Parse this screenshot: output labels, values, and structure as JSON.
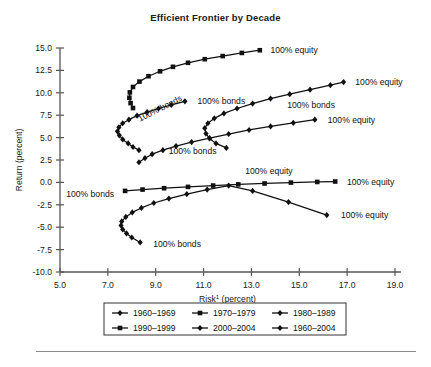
{
  "chart_data": {
    "type": "line",
    "title": "Efficient Frontier by Decade",
    "xlabel": "Risk¹ (percent)",
    "ylabel": "Return (percent)",
    "xlim": [
      5.0,
      19.0
    ],
    "ylim": [
      -10.0,
      15.0
    ],
    "xticks": [
      "5.0",
      "7.0",
      "9.0",
      "11.0",
      "13.0",
      "15.0",
      "17.0",
      "19.0"
    ],
    "yticks": [
      "15.0",
      "12.5",
      "10.0",
      "7.5",
      "5.0",
      "2.5",
      "0.0",
      "-2.5",
      "-5.0",
      "-7.5",
      "-10.0"
    ],
    "grid": false,
    "legend_position": "bottom",
    "series": [
      {
        "name": "1960–1969",
        "marker": "diamond",
        "bonds_label": "100% bonds",
        "equity_label": "100% equity",
        "points": [
          [
            8.3,
            3.6
          ],
          [
            8.05,
            3.95
          ],
          [
            7.85,
            4.35
          ],
          [
            7.62,
            4.8
          ],
          [
            7.48,
            5.25
          ],
          [
            7.4,
            5.7
          ],
          [
            7.46,
            6.15
          ],
          [
            7.62,
            6.6
          ],
          [
            7.88,
            7.0
          ],
          [
            8.22,
            7.45
          ],
          [
            8.64,
            7.85
          ],
          [
            9.12,
            8.25
          ],
          [
            9.65,
            8.65
          ],
          [
            10.22,
            9.05
          ]
        ]
      },
      {
        "name": "1970–1979",
        "marker": "square",
        "bonds_label": "100% bonds",
        "equity_label": "100% equity",
        "points": [
          [
            7.72,
            -0.95
          ],
          [
            8.45,
            -0.8
          ],
          [
            9.35,
            -0.65
          ],
          [
            10.35,
            -0.5
          ],
          [
            11.4,
            -0.35
          ],
          [
            12.45,
            -0.22
          ],
          [
            13.55,
            -0.12
          ],
          [
            14.65,
            -0.02
          ],
          [
            15.75,
            0.05
          ],
          [
            16.5,
            0.1
          ]
        ]
      },
      {
        "name": "1980–1989",
        "marker": "diamond",
        "bonds_label": "100% bonds",
        "equity_label": "100% equity",
        "points": [
          [
            11.95,
            3.85
          ],
          [
            11.52,
            4.35
          ],
          [
            11.25,
            4.9
          ],
          [
            11.1,
            5.45
          ],
          [
            11.05,
            6.05
          ],
          [
            11.18,
            6.6
          ],
          [
            11.45,
            7.15
          ],
          [
            11.85,
            7.7
          ],
          [
            12.4,
            8.25
          ],
          [
            13.05,
            8.8
          ],
          [
            13.8,
            9.35
          ],
          [
            14.6,
            9.85
          ],
          [
            15.45,
            10.35
          ],
          [
            16.3,
            10.85
          ],
          [
            16.85,
            11.2
          ]
        ]
      },
      {
        "name": "1990–1999",
        "marker": "square",
        "bonds_label": "100% bonds",
        "equity_label": "100% equity",
        "points": [
          [
            8.05,
            8.3
          ],
          [
            7.95,
            8.85
          ],
          [
            7.9,
            9.45
          ],
          [
            7.92,
            10.05
          ],
          [
            8.05,
            10.65
          ],
          [
            8.32,
            11.25
          ],
          [
            8.7,
            11.85
          ],
          [
            9.18,
            12.4
          ],
          [
            9.72,
            12.9
          ],
          [
            10.35,
            13.35
          ],
          [
            11.05,
            13.75
          ],
          [
            11.8,
            14.1
          ],
          [
            12.6,
            14.45
          ],
          [
            13.35,
            14.75
          ]
        ]
      },
      {
        "name": "2000–2004",
        "marker": "diamond",
        "bonds_label": "100% bonds",
        "equity_label": "100% equity",
        "points": [
          [
            8.35,
            -6.7
          ],
          [
            8.0,
            -6.15
          ],
          [
            7.78,
            -5.7
          ],
          [
            7.62,
            -5.25
          ],
          [
            7.55,
            -4.8
          ],
          [
            7.58,
            -4.35
          ],
          [
            7.75,
            -3.85
          ],
          [
            8.02,
            -3.35
          ],
          [
            8.4,
            -2.85
          ],
          [
            8.92,
            -2.3
          ],
          [
            9.55,
            -1.8
          ],
          [
            10.3,
            -1.3
          ],
          [
            11.15,
            -0.8
          ],
          [
            12.05,
            -0.35
          ],
          [
            13.05,
            -0.95
          ],
          [
            14.55,
            -2.2
          ],
          [
            16.15,
            -3.65
          ]
        ]
      },
      {
        "name": "1960–2004",
        "marker": "diamond",
        "bonds_label": "100% bonds",
        "equity_label": "100% equity",
        "points": [
          [
            8.3,
            2.25
          ],
          [
            8.55,
            2.7
          ],
          [
            8.85,
            3.15
          ],
          [
            9.3,
            3.6
          ],
          [
            9.85,
            4.05
          ],
          [
            10.5,
            4.5
          ],
          [
            11.25,
            4.95
          ],
          [
            12.05,
            5.4
          ],
          [
            12.9,
            5.85
          ],
          [
            13.8,
            6.25
          ],
          [
            14.75,
            6.65
          ],
          [
            15.65,
            7.0
          ]
        ]
      }
    ],
    "annotations": [
      {
        "text": "100% equity",
        "x": 13.5,
        "y": 14.75,
        "anchor": "start"
      },
      {
        "text": "100% equity",
        "x": 17.05,
        "y": 11.2,
        "anchor": "start"
      },
      {
        "text": "100% bonds",
        "x": 10.45,
        "y": 9.05,
        "anchor": "start"
      },
      {
        "text": "100% bonds",
        "x": 14.2,
        "y": 8.6,
        "anchor": "start"
      },
      {
        "text": "100% bonds",
        "x": 8.05,
        "y": 7.1,
        "anchor": "start",
        "rotate": -27
      },
      {
        "text": "100% equity",
        "x": 15.9,
        "y": 7.0,
        "anchor": "start"
      },
      {
        "text": "100% bonds",
        "x": 9.25,
        "y": 3.55,
        "anchor": "start"
      },
      {
        "text": "100% equity",
        "x": 12.45,
        "y": 1.25,
        "anchor": "start"
      },
      {
        "text": "100% bonds",
        "x": 7.55,
        "y": -1.35,
        "anchor": "end"
      },
      {
        "text": "100% equity",
        "x": 16.7,
        "y": 0.1,
        "anchor": "start"
      },
      {
        "text": "100% equity",
        "x": 16.45,
        "y": -3.65,
        "anchor": "start"
      },
      {
        "text": "100% bonds",
        "x": 8.6,
        "y": -6.85,
        "anchor": "start"
      }
    ]
  },
  "legend": {
    "rows": [
      [
        {
          "label": "1960–1969",
          "marker": "diamond"
        },
        {
          "label": "1970–1979",
          "marker": "square"
        },
        {
          "label": "1980–1989",
          "marker": "diamond"
        }
      ],
      [
        {
          "label": "1990–1999",
          "marker": "square"
        },
        {
          "label": "2000–2004",
          "marker": "diamond"
        },
        {
          "label": "1960–2004",
          "marker": "diamond"
        }
      ]
    ]
  },
  "colors": {
    "line": "#111111",
    "axis": "#555555",
    "rule": "#8d8d8d",
    "text": "#1a1a1a"
  }
}
